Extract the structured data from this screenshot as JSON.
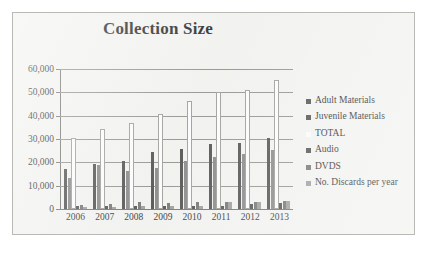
{
  "chart_data": {
    "type": "bar",
    "title": "Collection Size",
    "xlabel": "",
    "ylabel": "",
    "ylim": [
      0,
      60000
    ],
    "ytick_labels": [
      "60,000",
      "50,000",
      "40,000",
      "30,000",
      "20,000",
      "10,000",
      "0"
    ],
    "ytick_values": [
      60000,
      50000,
      40000,
      30000,
      20000,
      10000,
      0
    ],
    "grid": true,
    "legend_position": "right",
    "categories": [
      "2006",
      "2007",
      "2008",
      "2009",
      "2010",
      "2011",
      "2012",
      "2013"
    ],
    "series": [
      {
        "name": "Adult Materials",
        "color": "#4a4a4a",
        "values": [
          17000,
          19100,
          20500,
          24400,
          25900,
          27800,
          28500,
          30400
        ]
      },
      {
        "name": "Juvenile Materials",
        "color": "#848484",
        "values": [
          13500,
          18700,
          16100,
          17500,
          20400,
          22300,
          23600,
          25300
        ]
      },
      {
        "name": "TOTAL",
        "color": "#fdfdfd",
        "values": [
          30500,
          34100,
          36800,
          40800,
          46500,
          50000,
          51100,
          55400
        ]
      },
      {
        "name": "Audio",
        "color": "#4a4a4a",
        "values": [
          1200,
          1100,
          1300,
          1300,
          1300,
          1500,
          2100,
          2500
        ]
      },
      {
        "name": "DVDS",
        "color": "#6f6f6f",
        "values": [
          1600,
          2100,
          2900,
          2400,
          3100,
          2900,
          3200,
          3300
        ]
      },
      {
        "name": "No. Discards per year",
        "color": "#9a9a9a",
        "values": [
          900,
          1000,
          1100,
          1100,
          1200,
          2800,
          2900,
          3500
        ]
      }
    ]
  },
  "legend": {
    "items": [
      {
        "label": "Adult Materials"
      },
      {
        "label": "Juvenile Materials"
      },
      {
        "label": "TOTAL"
      },
      {
        "label": "Audio"
      },
      {
        "label": "DVDS"
      },
      {
        "label": "No. Discards per year"
      }
    ]
  }
}
